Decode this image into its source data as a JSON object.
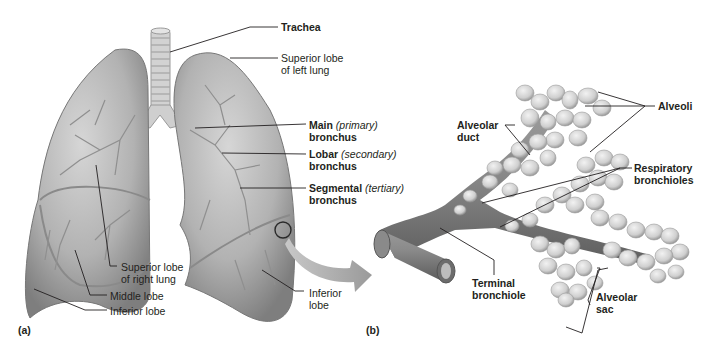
{
  "figure": {
    "panel_a": "(a)",
    "panel_b": "(b)",
    "labels_a": {
      "trachea": "Trachea",
      "superior_left_1": "Superior lobe",
      "superior_left_2": "of left lung",
      "main_b": "Main",
      "main_i": "(primary)",
      "main_2": "bronchus",
      "lobar_b": "Lobar",
      "lobar_i": "(secondary)",
      "lobar_2": "bronchus",
      "segmental_b": "Segmental",
      "segmental_i": "(tertiary)",
      "segmental_2": "bronchus",
      "superior_right_1": "Superior lobe",
      "superior_right_2": "of right lung",
      "middle_lobe": "Middle lobe",
      "inferior_lobe_right": "Inferior lobe",
      "inferior_lobe_left_1": "Inferior",
      "inferior_lobe_left_2": "lobe"
    },
    "labels_b": {
      "alveoli": "Alveoli",
      "alveolar_duct_1": "Alveolar",
      "alveolar_duct_2": "duct",
      "respiratory_1": "Respiratory",
      "respiratory_2": "bronchioles",
      "terminal_1": "Terminal",
      "terminal_2": "bronchiole",
      "sac_1": "Alveolar",
      "sac_2": "sac"
    },
    "colors": {
      "lung_fill": "#a9a9a9",
      "lung_light": "#d4d4d4",
      "lung_dark": "#7b7b7b",
      "vessel": "#8c8c8c",
      "alveoli": "#d8d8d8",
      "leader": "#231f20"
    }
  }
}
